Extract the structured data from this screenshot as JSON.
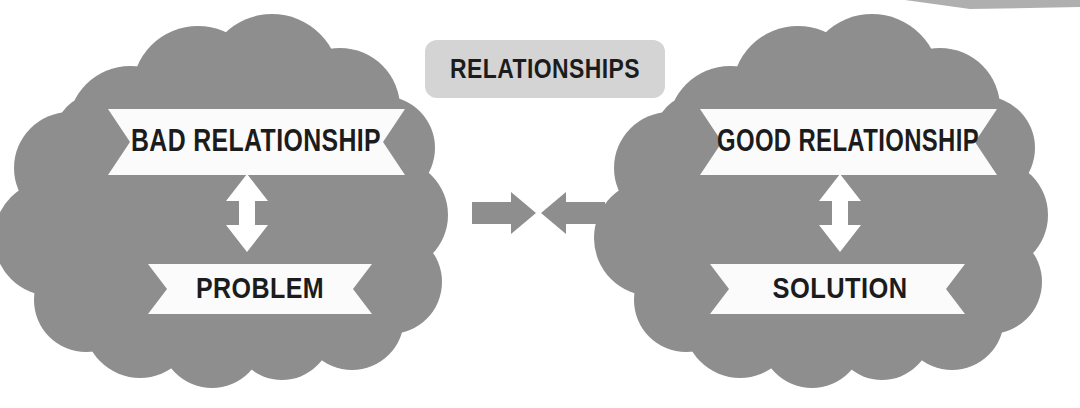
{
  "canvas": {
    "width": 1080,
    "height": 408,
    "background": "#ffffff"
  },
  "palette": {
    "cloud_gray": "#8e8e8e",
    "arrow_gray": "#8e8e8e",
    "chip_gray": "#d4d4d4",
    "banner_white": "#fbfbfb",
    "text_dark": "#1c1c1c",
    "white_arrow": "#ffffff",
    "top_sliver": "#6e6e6e"
  },
  "title_chip": {
    "label": "RELATIONSHIPS",
    "fill": "#d4d4d4",
    "text_color": "#1c1c1c",
    "x": 425,
    "y": 40,
    "width": 240,
    "height": 58,
    "radius": 12
  },
  "left_group": {
    "name": "bad-relationship-cloud",
    "fill": "#8e8e8e",
    "top_banner": {
      "label": "BAD RELATIONSHIP",
      "fill": "#fbfbfb",
      "text_color": "#1c1c1c"
    },
    "bottom_banner": {
      "label": "PROBLEM",
      "fill": "#fbfbfb",
      "text_color": "#1c1c1c"
    },
    "connector": {
      "icon": "double-headed-vertical-arrow",
      "color": "#ffffff"
    }
  },
  "right_group": {
    "name": "good-relationship-cloud",
    "fill": "#8e8e8e",
    "top_banner": {
      "label": "GOOD RELATIONSHIP",
      "fill": "#fbfbfb",
      "text_color": "#1c1c1c"
    },
    "bottom_banner": {
      "label": "SOLUTION",
      "fill": "#fbfbfb",
      "text_color": "#1c1c1c"
    },
    "connector": {
      "icon": "double-headed-vertical-arrow",
      "color": "#ffffff"
    }
  },
  "center_arrows": {
    "left_arrow": {
      "icon": "arrow-right-icon",
      "color": "#8e8e8e"
    },
    "right_arrow": {
      "icon": "arrow-left-icon",
      "color": "#8e8e8e"
    }
  }
}
